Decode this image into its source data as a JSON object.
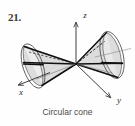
{
  "figure": {
    "exercise_number": "21.",
    "caption": "Circular cone",
    "background_color": "#fefefe",
    "surface_fill": "#d8d8d8",
    "surface_fill_light": "#e6e6e6",
    "outline_color": "#4a4a4a",
    "axis_color": "#2b2b2b",
    "generator_color": "#111111"
  },
  "axes": [
    {
      "id": "z",
      "label": "z",
      "direction": "up",
      "label_x": 85,
      "label_y": 18
    },
    {
      "id": "y",
      "label": "y",
      "direction": "down-right",
      "label_x": 119,
      "label_y": 103
    },
    {
      "id": "x",
      "label": "x",
      "direction": "down-left",
      "label_x": 21,
      "label_y": 95
    }
  ],
  "geometry": {
    "apex_x": 76,
    "apex_y": 64,
    "left_ellipse": {
      "cx": 33,
      "cy": 66,
      "rx": 10,
      "ry": 23,
      "rotation": -18
    },
    "right_ellipse": {
      "cx": 112,
      "cy": 55,
      "rx": 11,
      "ry": 24,
      "rotation": -14
    },
    "z_axis_tip": {
      "x": 76,
      "y": 20
    },
    "y_axis_tip": {
      "x": 112,
      "y": 99
    },
    "x_axis_tip": {
      "x": 17,
      "y": 86
    }
  }
}
